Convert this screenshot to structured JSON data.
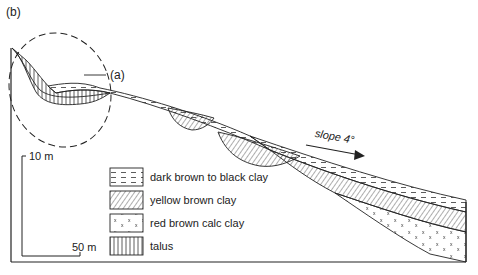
{
  "figure": {
    "panel_label": "(b)",
    "inset_ref_label": "(a)",
    "slope_label": "slope 4°",
    "scale": {
      "vertical": "10 m",
      "horizontal": "50 m"
    }
  },
  "legend": {
    "items": [
      {
        "pattern": "dashes",
        "label": "dark brown to black clay"
      },
      {
        "pattern": "diagonal-hatch",
        "label": "yellow brown clay"
      },
      {
        "pattern": "x-marks",
        "label": "red brown calc clay"
      },
      {
        "pattern": "vertical-lines",
        "label": "talus"
      }
    ]
  },
  "colors": {
    "ink": "#222222",
    "background": "#ffffff"
  }
}
